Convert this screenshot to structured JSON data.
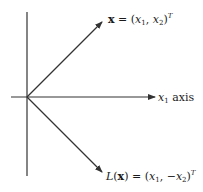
{
  "diagram": {
    "colors": {
      "line": "#333333",
      "background": "#ffffff",
      "text": "#1a1a1a"
    },
    "origin": [
      27,
      97
    ],
    "axes": {
      "vertical": {
        "x": 27,
        "y_top": 12,
        "y_bottom": 176
      },
      "horizontal": {
        "y": 97,
        "x_left": 11,
        "x_right": 155,
        "arrow": true,
        "label": "x1 axis"
      }
    },
    "vectors": [
      {
        "name": "x",
        "from": [
          27,
          97
        ],
        "to": [
          102,
          22
        ],
        "label": "x = (x1, x2)^T"
      },
      {
        "name": "L(x)",
        "from": [
          27,
          97
        ],
        "to": [
          102,
          172
        ],
        "label": "L(x) = (x1, −x2)^T"
      }
    ]
  },
  "labels": {
    "vector_x": {
      "bold_x": "x",
      "equals": " = (",
      "x1": "x",
      "x1_sub": "1",
      "comma": ", ",
      "x2": "x",
      "x2_sub": "2",
      "close": ")",
      "sup": "T"
    },
    "vector_lx": {
      "L": "L",
      "open": "(",
      "bold_x": "x",
      "equals": ") = (",
      "x1": "x",
      "x1_sub": "1",
      "comma": ", −",
      "x2": "x",
      "x2_sub": "2",
      "close": ")",
      "sup": "T"
    },
    "axis": {
      "x": "x",
      "sub": "1",
      "word": " axis"
    }
  }
}
